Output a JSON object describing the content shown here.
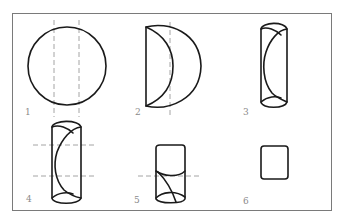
{
  "figure": {
    "colors": {
      "frame": "#7a7a7a",
      "outline": "#1a1a1a",
      "fold_line": "#9a9a9a",
      "label": "#8a8a8a",
      "background": "#ffffff"
    },
    "steps": [
      {
        "number": "1",
        "shape": "circle",
        "fold_lines": "two vertical dashed lines"
      },
      {
        "number": "2",
        "shape": "half-circle folded (D-shape)",
        "fold_lines": "one vertical dashed line"
      },
      {
        "number": "3",
        "shape": "tall roll with curved inner flap",
        "fold_lines": "none"
      },
      {
        "number": "4",
        "shape": "tall roll with curved inner flap",
        "fold_lines": "two horizontal dashed lines"
      },
      {
        "number": "5",
        "shape": "shorter roll with crossed flaps",
        "fold_lines": "one horizontal dashed line"
      },
      {
        "number": "6",
        "shape": "small rounded square",
        "fold_lines": "none"
      }
    ]
  }
}
